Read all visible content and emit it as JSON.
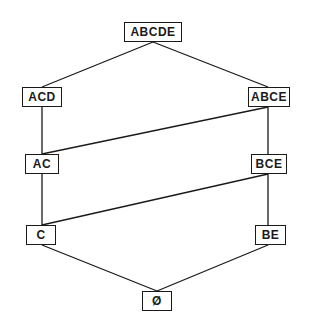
{
  "diagram": {
    "type": "lattice",
    "nodes": [
      {
        "id": "ABCDE",
        "label": "ABCDE",
        "x": 124,
        "y": 22,
        "w": 58,
        "h": 20
      },
      {
        "id": "ACD",
        "label": "ACD",
        "x": 22,
        "y": 87,
        "w": 40,
        "h": 20
      },
      {
        "id": "ABCE",
        "label": "ABCE",
        "x": 248,
        "y": 87,
        "w": 42,
        "h": 20
      },
      {
        "id": "AC",
        "label": "AC",
        "x": 25,
        "y": 154,
        "w": 34,
        "h": 20
      },
      {
        "id": "BCE",
        "label": "BCE",
        "x": 251,
        "y": 154,
        "w": 36,
        "h": 20
      },
      {
        "id": "C",
        "label": "C",
        "x": 26,
        "y": 225,
        "w": 30,
        "h": 20
      },
      {
        "id": "BE",
        "label": "BE",
        "x": 255,
        "y": 225,
        "w": 31,
        "h": 20
      },
      {
        "id": "EMPTY",
        "label": "Ø",
        "x": 142,
        "y": 291,
        "w": 30,
        "h": 20
      }
    ],
    "edges": [
      {
        "from": "ABCDE",
        "to": "ACD",
        "x1": 153,
        "y1": 42,
        "x2": 42,
        "y2": 87
      },
      {
        "from": "ABCDE",
        "to": "ABCE",
        "x1": 153,
        "y1": 42,
        "x2": 268,
        "y2": 87
      },
      {
        "from": "ACD",
        "to": "AC",
        "x1": 42,
        "y1": 107,
        "x2": 42,
        "y2": 154
      },
      {
        "from": "ABCE",
        "to": "AC",
        "x1": 268,
        "y1": 107,
        "x2": 42,
        "y2": 154
      },
      {
        "from": "ABCE",
        "to": "BCE",
        "x1": 268,
        "y1": 107,
        "x2": 268,
        "y2": 154
      },
      {
        "from": "AC",
        "to": "C",
        "x1": 42,
        "y1": 174,
        "x2": 42,
        "y2": 225
      },
      {
        "from": "BCE",
        "to": "C",
        "x1": 268,
        "y1": 174,
        "x2": 42,
        "y2": 225
      },
      {
        "from": "BCE",
        "to": "BE",
        "x1": 268,
        "y1": 174,
        "x2": 268,
        "y2": 225
      },
      {
        "from": "C",
        "to": "EMPTY",
        "x1": 42,
        "y1": 245,
        "x2": 157,
        "y2": 291
      },
      {
        "from": "BE",
        "to": "EMPTY",
        "x1": 268,
        "y1": 245,
        "x2": 157,
        "y2": 291
      }
    ],
    "colors": {
      "stroke": "#1a1a1a",
      "background": "#ffffff"
    }
  }
}
